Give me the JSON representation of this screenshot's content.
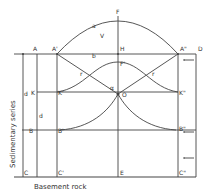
{
  "diagram": {
    "side_label": "Sedimentary series",
    "bottom_label": "Basement rock",
    "points": {
      "A": "A",
      "A1": "A'",
      "A2": "A\"",
      "D": "D",
      "F": "F",
      "F1": "F'",
      "H": "H",
      "K": "K",
      "K1": "K'",
      "K2": "K\"",
      "B": "B",
      "B1": "B'",
      "B2": "B\"",
      "C": "C",
      "C1": "C'",
      "C2": "C\"",
      "E": "E",
      "O": "O"
    },
    "segments": {
      "a": "a",
      "b": "b",
      "r": "r",
      "r2": "r",
      "d": "d",
      "d2": "d",
      "V": "V",
      "alpha": "α"
    },
    "colors": {
      "line": "#444444",
      "text": "#333333",
      "background": "#ffffff"
    }
  }
}
